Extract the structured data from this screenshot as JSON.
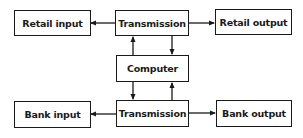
{
  "diagram": {
    "nodes": {
      "retail_input": {
        "label": "Retail input"
      },
      "transmission_top": {
        "label": "Transmission"
      },
      "retail_output": {
        "label": "Retail output"
      },
      "computer": {
        "label": "Computer"
      },
      "bank_input": {
        "label": "Bank input"
      },
      "transmission_bottom": {
        "label": "Transmission"
      },
      "bank_output": {
        "label": "Bank output"
      }
    },
    "edges": [
      {
        "from": "transmission_top",
        "to": "retail_input"
      },
      {
        "from": "transmission_top",
        "to": "retail_output"
      },
      {
        "from": "transmission_top",
        "to": "computer"
      },
      {
        "from": "computer",
        "to": "transmission_top"
      },
      {
        "from": "computer",
        "to": "transmission_bottom"
      },
      {
        "from": "transmission_bottom",
        "to": "computer"
      },
      {
        "from": "transmission_bottom",
        "to": "bank_input"
      },
      {
        "from": "transmission_bottom",
        "to": "bank_output"
      }
    ],
    "line_color": "#1a1a1a"
  }
}
